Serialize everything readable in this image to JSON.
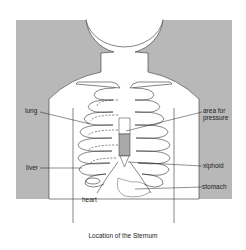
{
  "diagram": {
    "title": "Location of the Sternum",
    "labels": {
      "lung": "lung",
      "liver": "liver",
      "heart": "heart",
      "area_for_pressure_line1": "area for",
      "area_for_pressure_line2": "pressure",
      "xiphoid": "xiphoid",
      "stomach": "stomach"
    },
    "colors": {
      "background_panel": "#b8b8b8",
      "body": "#ffffff",
      "sternum_pressure_area": "#a9a9a9",
      "outline": "#333333"
    }
  }
}
